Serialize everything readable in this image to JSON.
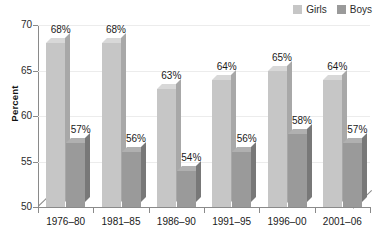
{
  "chart_data": {
    "type": "bar",
    "title": "",
    "subtitle": "",
    "xlabel": "",
    "ylabel": "Percent",
    "ylim": [
      50,
      70
    ],
    "yticks": [
      50,
      55,
      60,
      65,
      70
    ],
    "grid": true,
    "legend_position": "top-right",
    "style": "3d-grouped-column",
    "categories": [
      "1976–80",
      "1981–85",
      "1986–90",
      "1991–95",
      "1996–00",
      "2001–06"
    ],
    "series": [
      {
        "name": "Girls",
        "color": "#c6c6c6",
        "values": [
          68,
          68,
          63,
          64,
          65,
          64
        ],
        "labels": [
          "68%",
          "68%",
          "63%",
          "64%",
          "65%",
          "64%"
        ]
      },
      {
        "name": "Boys",
        "color": "#9a9a9a",
        "values": [
          57,
          56,
          54,
          56,
          58,
          57
        ],
        "labels": [
          "57%",
          "56%",
          "54%",
          "56%",
          "58%",
          "57%"
        ]
      }
    ]
  },
  "legend": {
    "items": [
      {
        "label": "Girls",
        "color": "#c6c6c6"
      },
      {
        "label": "Boys",
        "color": "#9a9a9a"
      }
    ]
  },
  "axes": {
    "y": {
      "label": "Percent",
      "ticks": [
        "70",
        "65",
        "60",
        "55",
        "50"
      ]
    },
    "x": {
      "ticks": [
        "1976–80",
        "1981–85",
        "1986–90",
        "1991–95",
        "1996–00",
        "2001–06"
      ]
    }
  },
  "colors": {
    "girls": "#c6c6c6",
    "girls_top": "#d8d8d8",
    "girls_side": "#a8a8a8",
    "boys": "#9a9a9a",
    "boys_top": "#b0b0b0",
    "boys_side": "#787878",
    "axis": "#8a8a8a",
    "grid": "#ececec",
    "text": "#1a1a1a",
    "background": "#ffffff"
  }
}
